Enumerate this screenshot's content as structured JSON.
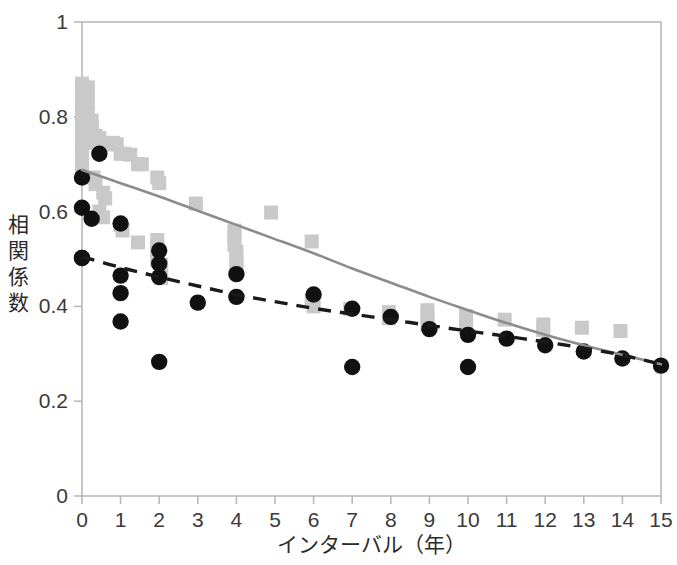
{
  "chart_data": {
    "type": "scatter",
    "title": "",
    "xlabel": "インターバル（年）",
    "ylabel": "相関係数",
    "xlim": [
      0,
      15
    ],
    "ylim": [
      0,
      1
    ],
    "xticks": [
      "0",
      "1",
      "2",
      "3",
      "4",
      "5",
      "6",
      "7",
      "8",
      "9",
      "10",
      "11",
      "12",
      "13",
      "14",
      "15"
    ],
    "yticks": [
      "0",
      "0.2",
      "0.4",
      "0.6",
      "0.8",
      "1"
    ],
    "grid": false,
    "legend": "none",
    "series": [
      {
        "name": "gray-squares",
        "marker": "square",
        "color": "#c9c9c9",
        "points": [
          [
            0.0,
            0.87
          ],
          [
            0.0,
            0.855
          ],
          [
            0.0,
            0.838
          ],
          [
            0.0,
            0.82
          ],
          [
            0.0,
            0.8
          ],
          [
            0.0,
            0.79
          ],
          [
            0.0,
            0.775
          ],
          [
            0.0,
            0.762
          ],
          [
            0.0,
            0.75
          ],
          [
            0.0,
            0.738
          ],
          [
            0.0,
            0.725
          ],
          [
            0.0,
            0.712
          ],
          [
            0.0,
            0.7
          ],
          [
            0.0,
            0.685
          ],
          [
            0.15,
            0.862
          ],
          [
            0.15,
            0.845
          ],
          [
            0.15,
            0.828
          ],
          [
            0.15,
            0.81
          ],
          [
            0.25,
            0.792
          ],
          [
            0.25,
            0.778
          ],
          [
            0.25,
            0.768
          ],
          [
            0.35,
            0.76
          ],
          [
            0.35,
            0.745
          ],
          [
            0.45,
            0.755
          ],
          [
            0.45,
            0.742
          ],
          [
            0.3,
            0.672
          ],
          [
            0.35,
            0.658
          ],
          [
            0.55,
            0.745
          ],
          [
            0.65,
            0.742
          ],
          [
            0.8,
            0.745
          ],
          [
            0.9,
            0.742
          ],
          [
            0.55,
            0.64
          ],
          [
            0.6,
            0.628
          ],
          [
            1.0,
            0.722
          ],
          [
            1.1,
            0.722
          ],
          [
            1.25,
            0.72
          ],
          [
            0.45,
            0.6
          ],
          [
            0.55,
            0.588
          ],
          [
            1.45,
            0.7
          ],
          [
            1.55,
            0.7
          ],
          [
            1.0,
            0.572
          ],
          [
            1.05,
            0.56
          ],
          [
            1.95,
            0.672
          ],
          [
            2.0,
            0.66
          ],
          [
            1.45,
            0.535
          ],
          [
            1.95,
            0.54
          ],
          [
            1.95,
            0.525
          ],
          [
            1.95,
            0.51
          ],
          [
            1.95,
            0.498
          ],
          [
            2.05,
            0.487
          ],
          [
            2.05,
            0.472
          ],
          [
            2.05,
            0.46
          ],
          [
            2.95,
            0.617
          ],
          [
            3.95,
            0.56
          ],
          [
            3.95,
            0.545
          ],
          [
            3.95,
            0.53
          ],
          [
            4.0,
            0.515
          ],
          [
            4.0,
            0.5
          ],
          [
            4.0,
            0.487
          ],
          [
            4.0,
            0.472
          ],
          [
            4.9,
            0.598
          ],
          [
            5.95,
            0.537
          ],
          [
            5.95,
            0.412
          ],
          [
            6.0,
            0.4
          ],
          [
            6.95,
            0.395
          ],
          [
            7.95,
            0.388
          ],
          [
            7.95,
            0.375
          ],
          [
            8.95,
            0.392
          ],
          [
            8.95,
            0.378
          ],
          [
            8.95,
            0.362
          ],
          [
            9.95,
            0.38
          ],
          [
            9.95,
            0.368
          ],
          [
            9.95,
            0.355
          ],
          [
            10.95,
            0.372
          ],
          [
            11.95,
            0.362
          ],
          [
            11.95,
            0.35
          ],
          [
            12.95,
            0.355
          ],
          [
            13.95,
            0.348
          ]
        ]
      },
      {
        "name": "black-circles",
        "marker": "circle",
        "color": "#111111",
        "points": [
          [
            0.0,
            0.672
          ],
          [
            0.0,
            0.608
          ],
          [
            0.0,
            0.502
          ],
          [
            0.25,
            0.585
          ],
          [
            0.45,
            0.722
          ],
          [
            0.0,
            0.502
          ],
          [
            1.0,
            0.575
          ],
          [
            1.0,
            0.465
          ],
          [
            1.0,
            0.428
          ],
          [
            1.0,
            0.368
          ],
          [
            2.0,
            0.518
          ],
          [
            2.0,
            0.49
          ],
          [
            2.0,
            0.462
          ],
          [
            2.0,
            0.283
          ],
          [
            3.0,
            0.408
          ],
          [
            4.0,
            0.468
          ],
          [
            4.0,
            0.42
          ],
          [
            6.0,
            0.425
          ],
          [
            7.0,
            0.395
          ],
          [
            7.0,
            0.272
          ],
          [
            8.0,
            0.378
          ],
          [
            9.0,
            0.352
          ],
          [
            10.0,
            0.34
          ],
          [
            10.0,
            0.272
          ],
          [
            11.0,
            0.332
          ],
          [
            12.0,
            0.318
          ],
          [
            13.0,
            0.305
          ],
          [
            14.0,
            0.29
          ],
          [
            15.0,
            0.275
          ]
        ]
      }
    ],
    "trendlines": [
      {
        "name": "gray-solid-curve",
        "style": "solid",
        "color": "#8c8c8c",
        "points": [
          [
            0.0,
            0.688
          ],
          [
            1.0,
            0.66
          ],
          [
            2.0,
            0.632
          ],
          [
            3.0,
            0.602
          ],
          [
            4.0,
            0.572
          ],
          [
            5.0,
            0.542
          ],
          [
            6.0,
            0.512
          ],
          [
            7.0,
            0.48
          ],
          [
            8.0,
            0.45
          ],
          [
            9.0,
            0.42
          ],
          [
            10.0,
            0.392
          ],
          [
            11.0,
            0.365
          ],
          [
            12.0,
            0.34
          ],
          [
            13.0,
            0.318
          ],
          [
            14.0,
            0.298
          ],
          [
            15.0,
            0.278
          ]
        ]
      },
      {
        "name": "black-dashed-curve",
        "style": "dashed",
        "color": "#1a1a1a",
        "points": [
          [
            0.0,
            0.505
          ],
          [
            1.0,
            0.482
          ],
          [
            2.0,
            0.462
          ],
          [
            3.0,
            0.443
          ],
          [
            4.0,
            0.425
          ],
          [
            5.0,
            0.41
          ],
          [
            6.0,
            0.396
          ],
          [
            7.0,
            0.384
          ],
          [
            8.0,
            0.372
          ],
          [
            9.0,
            0.36
          ],
          [
            10.0,
            0.348
          ],
          [
            11.0,
            0.337
          ],
          [
            12.0,
            0.325
          ],
          [
            13.0,
            0.312
          ],
          [
            14.0,
            0.297
          ],
          [
            15.0,
            0.278
          ]
        ]
      }
    ]
  },
  "axes": {
    "y_label_chars": [
      "相",
      "関",
      "係",
      "数"
    ],
    "x_label": "インターバル（年）",
    "frame_color": "#b9b9b9"
  }
}
